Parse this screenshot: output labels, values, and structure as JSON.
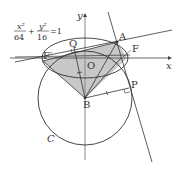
{
  "diagram": {
    "equation": {
      "x_num": "x²",
      "x_den": "64",
      "plus": "+",
      "y_num": "y²",
      "y_den": "16",
      "rhs": "=1"
    },
    "axes": {
      "x_label": "x",
      "y_label": "y"
    },
    "points": {
      "A": "A",
      "F": "F",
      "F_prime": "F′",
      "Q": "Q",
      "O": "O",
      "B": "B",
      "P": "P"
    },
    "circle_label": "C",
    "colors": {
      "stroke": "#333333",
      "fill": "#c8c8c8"
    }
  }
}
